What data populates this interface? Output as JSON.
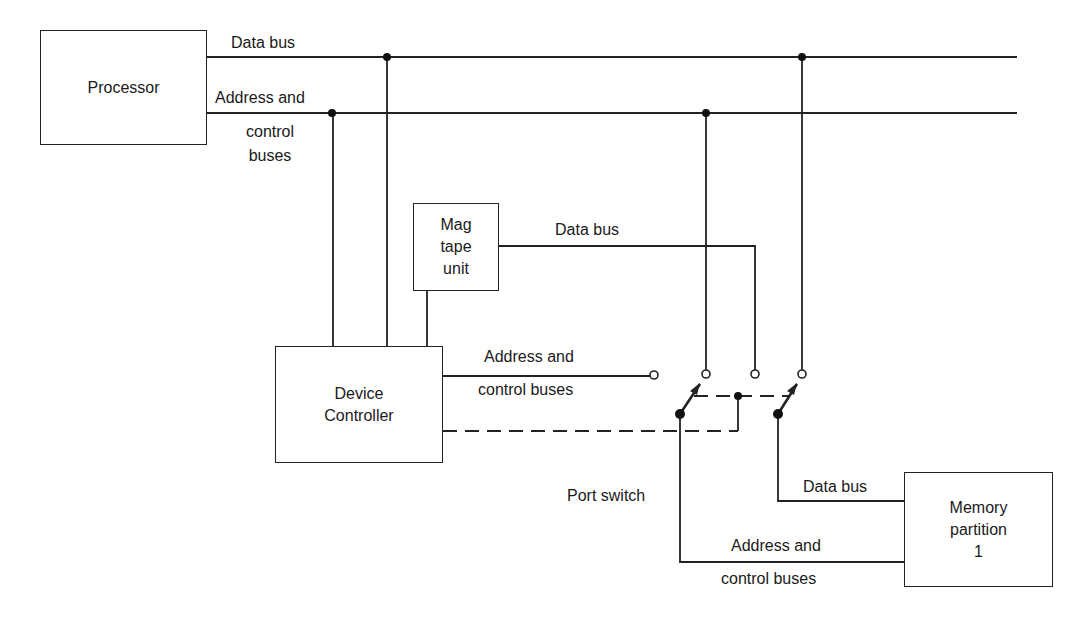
{
  "diagram": {
    "type": "block-diagram",
    "title": "",
    "blocks": {
      "processor": "Processor",
      "mag_tape_line1": "Mag",
      "mag_tape_line2": "tape",
      "mag_tape_line3": "unit",
      "device_controller_line1": "Device",
      "device_controller_line2": "Controller",
      "memory_line1": "Memory",
      "memory_line2": "partition",
      "memory_line3": "1"
    },
    "labels": {
      "top_data_bus": "Data bus",
      "top_address_line1": "Address and",
      "top_address_line2": "control",
      "top_address_line3": "buses",
      "mag_data_bus": "Data bus",
      "dc_address_line1": "Address and",
      "dc_address_line2": "control buses",
      "port_switch": "Port switch",
      "mem_data_bus": "Data bus",
      "mem_address_line1": "Address and",
      "mem_address_line2": "control buses"
    },
    "connections": [
      {
        "from": "Processor",
        "to": "Data bus (system)"
      },
      {
        "from": "Processor",
        "to": "Address and control buses (system)"
      },
      {
        "from": "Device Controller",
        "to": "Address and control buses (system)"
      },
      {
        "from": "Device Controller",
        "to": "Data bus (system)"
      },
      {
        "from": "Device Controller",
        "to": "Mag tape unit"
      },
      {
        "from": "Mag tape unit",
        "to": "Port switch (data)",
        "label": "Data bus"
      },
      {
        "from": "Device Controller",
        "to": "Port switch (address)",
        "label": "Address and control buses"
      },
      {
        "from": "Device Controller",
        "to": "Port switch",
        "style": "dashed",
        "label": "switch control"
      },
      {
        "from": "Port switch",
        "to": "Memory partition 1",
        "label": "Data bus"
      },
      {
        "from": "Port switch",
        "to": "Memory partition 1",
        "label": "Address and control buses"
      }
    ]
  }
}
